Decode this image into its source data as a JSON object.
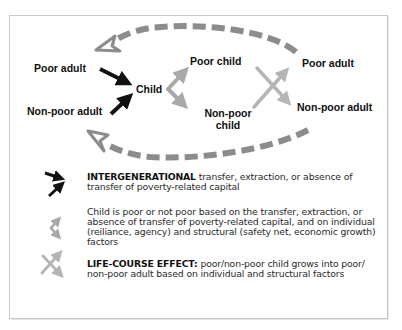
{
  "diagram": {
    "nodes": {
      "poor_adult_left": "Poor adult",
      "non_poor_adult_left": "Non-poor adult",
      "child": "Child",
      "poor_child": "Poor child",
      "non_poor_child_line1": "Non-poor",
      "non_poor_child_line2": "child",
      "poor_adult_right": "Poor adult",
      "non_poor_adult_right": "Non-poor adult"
    },
    "colors": {
      "intergenerational_arrow": "#111111",
      "child_outcome_arrow": "#a9a9a9",
      "life_course_arrow": "#b5b5b5",
      "cycle_dashed_arrow": "#8c8c8c",
      "frame_border": "#c9c9c9"
    }
  },
  "legend": {
    "items": [
      {
        "icon": "intergenerational-arrows-icon",
        "bold": "INTERGENERATIONAL",
        "text": " transfer, extraction, or absence of transfer of poverty-related capital"
      },
      {
        "icon": "child-outcome-arrows-icon",
        "bold": "",
        "text": "Child is poor or not poor based on the transfer, extraction, or absence of transfer of poverty-related capital, and on individual (reiliance, agency) and structural (safety net, economic growth) factors"
      },
      {
        "icon": "life-course-cross-arrows-icon",
        "bold": "LIFE-COURSE EFFECT:",
        "text": " poor/non-poor child grows into poor/ non-poor adult based on individual and structural factors"
      }
    ]
  }
}
